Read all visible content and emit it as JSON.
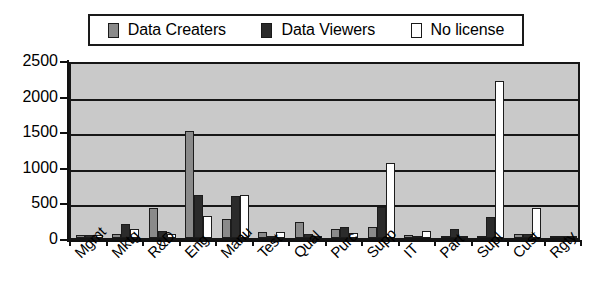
{
  "chart_data": {
    "type": "bar",
    "title": "",
    "subtitle": "",
    "xlabel": "",
    "ylabel": "",
    "ylim": [
      0,
      2500
    ],
    "yticks": [
      0,
      500,
      1000,
      1500,
      2000,
      2500
    ],
    "grid": true,
    "legend_position": "top",
    "categories": [
      "Mgmt",
      "Mktg",
      "R&D",
      "Eng",
      "Manu",
      "Test",
      "Qual",
      "Purc",
      "Supp",
      "IT",
      "Part",
      "Supl",
      "Cust",
      "Rgty"
    ],
    "series": [
      {
        "name": "Data Creaters",
        "color": "#8a8a8a",
        "values": [
          40,
          55,
          420,
          1500,
          270,
          80,
          230,
          120,
          150,
          40,
          25,
          30,
          60,
          30
        ]
      },
      {
        "name": "Data Viewers",
        "color": "#2b2b2b",
        "values": [
          40,
          200,
          100,
          600,
          590,
          25,
          60,
          150,
          440,
          15,
          130,
          300,
          60,
          30
        ]
      },
      {
        "name": "No license",
        "color": "#ffffff",
        "values": [
          40,
          130,
          55,
          310,
          600,
          85,
          30,
          70,
          1050,
          100,
          20,
          2200,
          420,
          30
        ]
      }
    ]
  },
  "legend": {
    "entries": [
      {
        "label": "Data Creaters",
        "swatch": "legend-swatch-creaters"
      },
      {
        "label": "Data Viewers",
        "swatch": "legend-swatch-viewers"
      },
      {
        "label": "No license",
        "swatch": "legend-swatch-nolicense"
      }
    ]
  },
  "axes": {
    "y_tick_labels": [
      "2500",
      "2000",
      "1500",
      "1000",
      "500",
      "0"
    ],
    "x_tick_labels": [
      "Mgmt",
      "Mktg",
      "R&D",
      "Eng",
      "Manu",
      "Test",
      "Qual",
      "Purc",
      "Supp",
      "IT",
      "Part",
      "Supl",
      "Cust",
      "Rgty"
    ]
  },
  "colors": {
    "plot_background": "#c9c9c9",
    "frame": "#161616",
    "gridline": "#171717",
    "series_creaters": "#8a8a8a",
    "series_viewers": "#2b2b2b",
    "series_nolicense": "#ffffff"
  }
}
